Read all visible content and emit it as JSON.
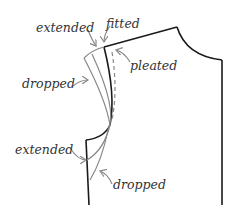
{
  "diagram": {
    "labels": {
      "extended_top": "extended",
      "fitted": "fitted",
      "pleated": "pleated",
      "dropped_top": "dropped",
      "extended_bottom": "extended",
      "dropped_bottom": "dropped"
    },
    "colors": {
      "outline": "#1a1a1a",
      "variant": "#888888",
      "text": "#333333"
    }
  }
}
